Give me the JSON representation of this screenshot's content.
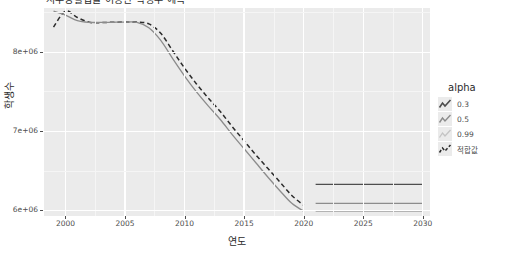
{
  "chart_data": {
    "type": "line",
    "title": "지수평활법을 이용한 학생수 예측",
    "xlabel": "연도",
    "ylabel": "학생수",
    "xlim": [
      1998.2,
      2030.6
    ],
    "ylim": [
      5930000,
      8560000
    ],
    "xticks": [
      2000,
      2005,
      2010,
      2015,
      2020,
      2025,
      2030
    ],
    "xticklabels": [
      "2000",
      "2005",
      "2010",
      "2015",
      "2020",
      "2025",
      "2030"
    ],
    "yticks": [
      6000000,
      7000000,
      8000000
    ],
    "yticklabels": [
      "6e+06",
      "7e+06",
      "8e+06"
    ],
    "grid": true,
    "legend_position": "right",
    "legend_title": "alpha",
    "series": [
      {
        "name": "적합값",
        "style": "dashed",
        "color": "#2b2b2b",
        "alpha": 1.0,
        "x": [
          1999,
          2000,
          2001,
          2002,
          2003,
          2004,
          2005,
          2006,
          2007,
          2008,
          2009,
          2010,
          2011,
          2012,
          2013,
          2014,
          2015,
          2016,
          2017,
          2018,
          2019,
          2020
        ],
        "y": [
          8318000,
          8520000,
          8440000,
          8380000,
          8375000,
          8380000,
          8382000,
          8383000,
          8360000,
          8240000,
          8020000,
          7800000,
          7600000,
          7420000,
          7250000,
          7060000,
          6880000,
          6700000,
          6530000,
          6360000,
          6190000,
          6065000
        ]
      },
      {
        "name": "관측값",
        "style": "solid",
        "color": "#8c8c8c",
        "alpha": 1.0,
        "x": [
          1999,
          2000,
          2001,
          2002,
          2003,
          2004,
          2005,
          2006,
          2007,
          2008,
          2009,
          2010,
          2011,
          2012,
          2013,
          2014,
          2015,
          2016,
          2017,
          2018,
          2019,
          2020
        ],
        "y": [
          8520000,
          8470000,
          8400000,
          8378000,
          8378000,
          8380000,
          8382000,
          8378000,
          8310000,
          8150000,
          7920000,
          7700000,
          7500000,
          7320000,
          7150000,
          6960000,
          6780000,
          6600000,
          6420000,
          6250000,
          6090000,
          5990000
        ]
      },
      {
        "name": "alpha=0.3",
        "style": "forecast",
        "color": "#4d4d4d",
        "alpha": 0.3,
        "x": [
          2021,
          2030
        ],
        "y": [
          6330000,
          6330000
        ]
      },
      {
        "name": "alpha=0.5",
        "style": "forecast",
        "color": "#8c8c8c",
        "alpha": 0.5,
        "x": [
          2021,
          2030
        ],
        "y": [
          6090000,
          6090000
        ]
      },
      {
        "name": "alpha=0.99",
        "style": "forecast",
        "color": "#b3b3b3",
        "alpha": 0.99,
        "x": [
          2021,
          2030
        ],
        "y": [
          5990000,
          5990000
        ]
      }
    ],
    "legend_entries": [
      {
        "label": "0.3",
        "key": "line-key-dark"
      },
      {
        "label": "0.5",
        "key": "line-key-mid"
      },
      {
        "label": "0.99",
        "key": "line-key-light"
      },
      {
        "label": "적합값",
        "key": "line-key-dashed"
      }
    ],
    "colors": {
      "panel": "#ebebeb",
      "grid_major": "#ffffff",
      "grid_minor": "#f5f5f5",
      "axis_text": "#4d4d4d",
      "axis_title": "#2b2b2b",
      "fitted_line": "#2b2b2b",
      "observed_line": "#8c8c8c"
    }
  }
}
